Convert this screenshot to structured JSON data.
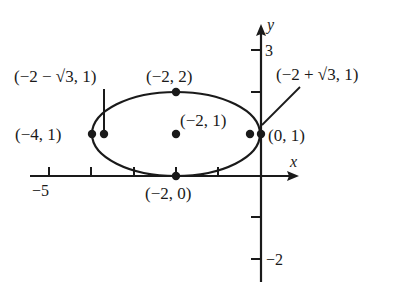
{
  "figure": {
    "x_axis_label": "x",
    "y_axis_label": "y",
    "tick_labels": {
      "x_minus5": "−5",
      "y_3": "3",
      "y_minus2": "−2"
    },
    "points": [
      {
        "id": "center",
        "label": "(−2, 1)",
        "x": -2,
        "y": 1
      },
      {
        "id": "top",
        "label": "(−2, 2)",
        "x": -2,
        "y": 2
      },
      {
        "id": "bottom",
        "label": "(−2, 0)",
        "x": -2,
        "y": 0
      },
      {
        "id": "left-vertex",
        "label": "(−4, 1)",
        "x": -4,
        "y": 1
      },
      {
        "id": "right-vertex",
        "label": "(0, 1)",
        "x": 0,
        "y": 1
      },
      {
        "id": "left-focus",
        "label": "(−2 − √3, 1)",
        "x": -3.732,
        "y": 1
      },
      {
        "id": "right-focus",
        "label": "(−2 + √3, 1)",
        "x": -0.268,
        "y": 1
      }
    ],
    "ellipse": {
      "center": [
        -2,
        1
      ],
      "semi_major": 2,
      "semi_minor": 1
    },
    "colors": {
      "ink": "#1a1a1a",
      "background": "#ffffff"
    }
  }
}
